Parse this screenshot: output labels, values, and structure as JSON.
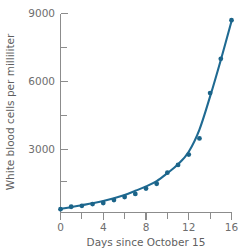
{
  "chart_data": {
    "type": "scatter",
    "title": "",
    "subtitle": "",
    "xlabel": "Days since October 15",
    "ylabel": "White blood cells per milliliter",
    "xlim": [
      0,
      16.6
    ],
    "ylim": [
      0,
      9300
    ],
    "grid": false,
    "legend": null,
    "x_ticks_major": [
      0,
      4,
      8,
      12,
      16
    ],
    "x_tick_labels": [
      "0",
      "4",
      "8",
      "12",
      "16"
    ],
    "x_ticks_minor": [
      2,
      6,
      10,
      14
    ],
    "y_ticks_major": [
      3000,
      6000,
      9000
    ],
    "y_tick_labels": [
      "3000",
      "6000",
      "9000"
    ],
    "y_ticks_minor": [
      1500,
      4500,
      7500
    ],
    "series": [
      {
        "name": "White blood cell count",
        "type": "scatter",
        "color": "#1b6489",
        "x": [
          0,
          1,
          2,
          3,
          4,
          5,
          6,
          7,
          8,
          9,
          10,
          11,
          12,
          13,
          14,
          15,
          16
        ],
        "values": [
          150,
          260,
          300,
          380,
          430,
          560,
          700,
          840,
          1080,
          1300,
          1800,
          2150,
          2620,
          3350,
          5400,
          6950,
          8700
        ]
      },
      {
        "name": "Exponential fit curve",
        "type": "line",
        "color": "#1f6a92",
        "x": [
          0,
          1,
          2,
          3,
          4,
          5,
          6,
          7,
          8,
          9,
          10,
          11,
          12,
          13,
          14,
          15,
          16
        ],
        "values": [
          170,
          240,
          330,
          420,
          520,
          640,
          790,
          980,
          1180,
          1420,
          1780,
          2180,
          2750,
          3750,
          5250,
          6900,
          8650
        ]
      }
    ],
    "annotations": [
      {
        "label": "outlier above fit",
        "x": 13,
        "y": 3350
      }
    ]
  },
  "axes": {
    "x_title": "Days since October 15",
    "y_title": "White blood cells per milliliter"
  },
  "colors": {
    "series": "#1b6489",
    "curve": "#1f6a92",
    "axis": "#8c8c8c",
    "tick_text": "#6e6e6e",
    "title_text": "#5f5f5f",
    "background": "#ffffff"
  }
}
